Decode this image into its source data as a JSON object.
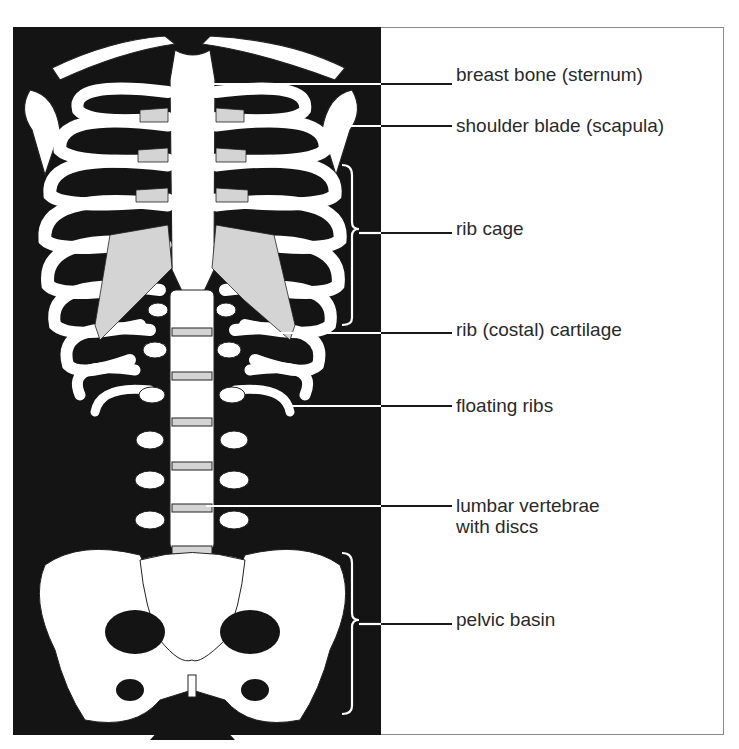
{
  "figure": {
    "colors": {
      "background_panel": "#141414",
      "bone": "#ffffff",
      "cartilage": "#d4d4d4",
      "leader_line": "#1a1a1a",
      "label_text": "#2a2a2a"
    }
  },
  "labels": [
    {
      "text": "breast bone (sternum)",
      "y": 76
    },
    {
      "text": "shoulder blade (scapula)",
      "y": 126
    },
    {
      "text": "rib cage",
      "y": 229
    },
    {
      "text": "rib (costal) cartilage",
      "y": 330
    },
    {
      "text": "floating ribs",
      "y": 406
    },
    {
      "text": "lumbar vertebrae",
      "line2": "with discs",
      "y": 506
    },
    {
      "text": "pelvic basin",
      "y": 620
    }
  ]
}
